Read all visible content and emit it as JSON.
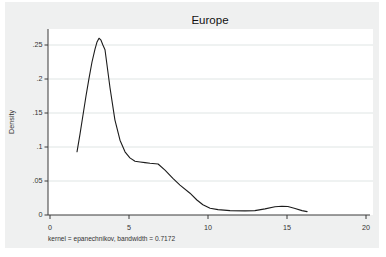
{
  "window": {
    "background_color": "#ffffff",
    "figure_background_color": "#eff0f0",
    "plot_background_color": "#ffffff",
    "gridline_color": "#dfe5e4",
    "axis_color": "#3a3a3a",
    "curve_color": "#1c1c1c"
  },
  "chart_data": {
    "type": "line",
    "title": "Europe",
    "xlabel": "",
    "ylabel": "Density",
    "note": "kernel = epanechnikov, bandwidth = 0.7172",
    "xlim": [
      0,
      20
    ],
    "ylim": [
      0,
      0.25
    ],
    "grid": "horizontal",
    "legend": "none",
    "x_ticks": [
      "0",
      "5",
      "10",
      "15",
      "20"
    ],
    "x_tick_values": [
      0,
      5,
      10,
      15,
      20
    ],
    "y_ticks": [
      "0",
      ".05",
      ".1",
      ".15",
      ".2",
      ".25"
    ],
    "y_tick_values": [
      0,
      0.05,
      0.1,
      0.15,
      0.2,
      0.25
    ],
    "series": [
      {
        "name": "kdensity",
        "x": [
          1.71,
          1.9,
          2.09,
          2.28,
          2.47,
          2.66,
          2.85,
          2.97,
          3.1,
          3.23,
          3.35,
          3.48,
          3.8,
          4.11,
          4.43,
          4.75,
          5.06,
          5.38,
          5.7,
          6.01,
          6.33,
          6.84,
          7.28,
          7.78,
          8.23,
          8.86,
          9.3,
          9.68,
          10.13,
          10.63,
          11.39,
          12.34,
          12.97,
          13.61,
          14.24,
          14.68,
          15.06,
          15.51,
          15.95,
          16.27
        ],
        "y": [
          0.093,
          0.119,
          0.147,
          0.175,
          0.201,
          0.225,
          0.244,
          0.254,
          0.26,
          0.257,
          0.25,
          0.243,
          0.187,
          0.14,
          0.11,
          0.093,
          0.084,
          0.079,
          0.078,
          0.077,
          0.076,
          0.075,
          0.066,
          0.054,
          0.044,
          0.032,
          0.022,
          0.015,
          0.01,
          0.008,
          0.0065,
          0.006,
          0.0065,
          0.009,
          0.012,
          0.013,
          0.0125,
          0.0095,
          0.0065,
          0.005
        ]
      }
    ]
  }
}
